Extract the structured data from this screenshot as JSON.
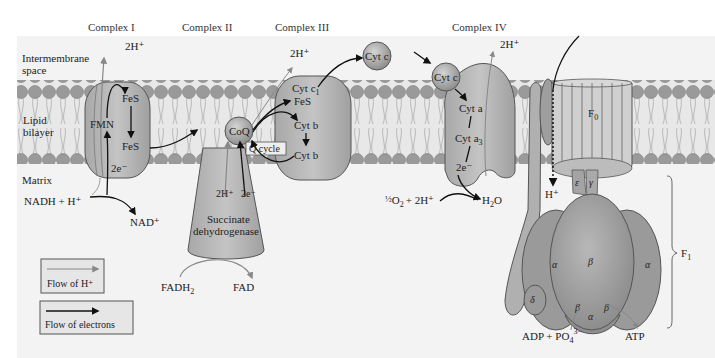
{
  "diagram": {
    "type": "oxidative-phosphorylation-electron-transport-chain",
    "complex_titles": [
      "Complex I",
      "Complex II",
      "Complex III",
      "Complex IV"
    ],
    "regions": {
      "intermembrane": "Intermembrane",
      "intermembrane2": "space",
      "lipid": "Lipid",
      "lipid2": "bilayer",
      "matrix": "Matrix"
    },
    "complex1": {
      "proton": "2H⁺",
      "fes_top": "FeS",
      "fmn": "FMN",
      "fes_bottom": "FeS",
      "electrons": "2e⁻",
      "nadh": "NADH + H⁺",
      "nad": "NAD⁺"
    },
    "complex2": {
      "coq": "CoQ",
      "proton": "2H⁺",
      "electrons": "2e⁻",
      "enzyme_line1": "Succinate",
      "enzyme_line2": "dehydrogenase",
      "fadh2": "FADH",
      "fadh2_sub": "2",
      "fad": "FAD"
    },
    "complex3": {
      "proton": "2H⁺",
      "cytc1": "Cyt c",
      "cytc1_sub": "1",
      "fes": "FeS",
      "cytb_top": "Cyt b",
      "cytb_bottom": "Cyt b",
      "qcycle": "Q cycle"
    },
    "cytc_mobile": [
      "Cyt c",
      "Cyt c"
    ],
    "complex4": {
      "proton": "2H⁺",
      "cyta": "Cyt a",
      "cyta3": "Cyt a",
      "cyta3_sub": "3",
      "electrons": "2e⁻",
      "oxygen_frac": "½",
      "oxygen": "O",
      "oxygen_sub": "2",
      "oxygen_rest": "+ 2H⁺",
      "water": "H",
      "water_sub": "2",
      "water_rest": "O"
    },
    "atp_synthase": {
      "f0": "F",
      "f0_sub": "0",
      "f1": "F",
      "f1_sub": "1",
      "proton": "H⁺",
      "epsilon": "ε",
      "gamma": "γ",
      "delta": "δ",
      "alpha": "α",
      "beta": "β",
      "adp": "ADP + PO",
      "adp_sub": "4",
      "adp_sup": "3−",
      "atp": "ATP"
    },
    "legend": [
      {
        "label": "Flow of H⁺",
        "color": "#888888"
      },
      {
        "label": "Flow of electrons",
        "color": "#111111"
      }
    ],
    "colors": {
      "membrane_bg": "#eeeeee",
      "head_groups": "#9a9a9a",
      "protein": "#b9b9b9",
      "protein_dark": "#a5a5a5",
      "outline": "#555555",
      "h_arrow": "#888888",
      "e_arrow": "#111111"
    }
  }
}
